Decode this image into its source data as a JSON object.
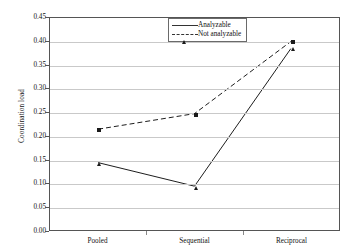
{
  "chart_data": {
    "type": "line",
    "title": "",
    "xlabel": "",
    "ylabel": "Coordination load",
    "categories": [
      "Pooled",
      "Sequential",
      "Reciprocal"
    ],
    "ylim": [
      0.0,
      0.45
    ],
    "ytick_labels": [
      "0.45",
      "0.40",
      "0.35",
      "0.30",
      "0.25",
      "0.20",
      "0.15",
      "0.10",
      "0.05",
      "0.00"
    ],
    "ytick_values": [
      0.45,
      0.4,
      0.35,
      0.3,
      0.25,
      0.2,
      0.15,
      0.1,
      0.05,
      0.0
    ],
    "grid": "horizontal",
    "legend_position": "top-center",
    "series": [
      {
        "name": "Analyzable",
        "values": [
          0.143,
          0.093,
          0.385
        ],
        "marker": "triangle",
        "line_style": "solid",
        "color": "#1a1a1a"
      },
      {
        "name": "Not analyzable",
        "values": [
          0.214,
          0.247,
          0.4
        ],
        "marker": "square",
        "line_style": "dashed",
        "color": "#1a1a1a"
      }
    ]
  },
  "legend": {
    "items": [
      {
        "label": "Analyzable"
      },
      {
        "label": "Not analyzable"
      }
    ]
  },
  "axes": {
    "y_title": "Coordination load"
  }
}
